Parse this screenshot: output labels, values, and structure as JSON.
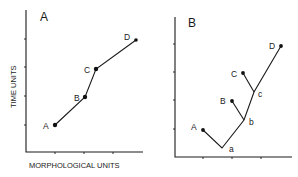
{
  "panels": [
    {
      "id": "A",
      "label": "A",
      "xlabel": "MORPHOLOGICAL UNITS",
      "ylabel": "TIME UNITS",
      "points": [
        {
          "label": "A"
        },
        {
          "label": "B"
        },
        {
          "label": "C"
        },
        {
          "label": "D"
        }
      ]
    },
    {
      "id": "B",
      "label": "B",
      "terminals": [
        {
          "label": "A"
        },
        {
          "label": "B"
        },
        {
          "label": "C"
        },
        {
          "label": "D"
        }
      ],
      "nodes": [
        {
          "label": "a"
        },
        {
          "label": "b"
        },
        {
          "label": "c"
        }
      ]
    }
  ],
  "colors": {
    "ink": "#1a1a1a",
    "background": "#ffffff"
  }
}
